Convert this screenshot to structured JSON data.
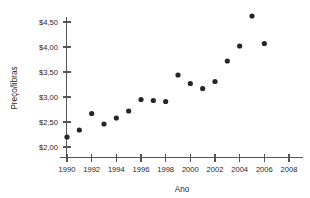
{
  "chart_data": {
    "type": "scatter",
    "title": "",
    "xlabel": "Ano",
    "ylabel": "Preço/libras",
    "xlim": [
      1989,
      2008.6
    ],
    "ylim": [
      1.86,
      4.72
    ],
    "xticks": [
      1990,
      1992,
      1994,
      1996,
      1998,
      2000,
      2002,
      2004,
      2006,
      2008
    ],
    "xticklabels": [
      "1990",
      "1992",
      "1994",
      "1996",
      "1998",
      "2000",
      "2002",
      "2004",
      "2006",
      "2008"
    ],
    "yticks": [
      2.0,
      2.5,
      3.0,
      3.5,
      4.0,
      4.5
    ],
    "yticklabels": [
      "$2,00",
      "$2,50",
      "$3,00",
      "$3,50",
      "$4,00",
      "$4,50"
    ],
    "grid": false,
    "legend": null,
    "marker": "circle",
    "marker_color": "#262626",
    "x": [
      1990,
      1991,
      1992,
      1993,
      1994,
      1995,
      1996,
      1997,
      1998,
      1999,
      2000,
      2001,
      2002,
      2003,
      2004,
      2005,
      2006
    ],
    "y": [
      2.2,
      2.34,
      2.67,
      2.46,
      2.58,
      2.72,
      2.95,
      2.93,
      2.91,
      3.44,
      3.27,
      3.17,
      3.31,
      3.72,
      4.02,
      4.62,
      4.07
    ],
    "points": [
      {
        "x": 1990,
        "y": 2.2
      },
      {
        "x": 1991,
        "y": 2.34
      },
      {
        "x": 1992,
        "y": 2.67
      },
      {
        "x": 1993,
        "y": 2.46
      },
      {
        "x": 1994,
        "y": 2.58
      },
      {
        "x": 1995,
        "y": 2.72
      },
      {
        "x": 1996,
        "y": 2.95
      },
      {
        "x": 1997,
        "y": 2.93
      },
      {
        "x": 1998,
        "y": 2.91
      },
      {
        "x": 1999,
        "y": 3.44
      },
      {
        "x": 2000,
        "y": 3.27
      },
      {
        "x": 2001,
        "y": 3.17
      },
      {
        "x": 2002,
        "y": 3.31
      },
      {
        "x": 2003,
        "y": 3.72
      },
      {
        "x": 2004,
        "y": 4.02
      },
      {
        "x": 2005,
        "y": 4.62
      },
      {
        "x": 2006,
        "y": 4.07
      }
    ]
  },
  "axes": {
    "y_title": "Preço/libras",
    "x_title": "Ano",
    "axis_color": "#555555",
    "text_color": "#1f1f1f"
  }
}
